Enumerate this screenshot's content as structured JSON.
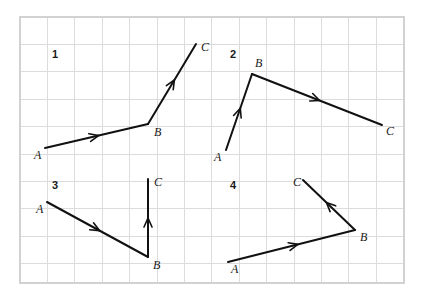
{
  "figure": {
    "background_color": "#ffffff",
    "ink_color": "#111111",
    "grid_color": "#dcdcdc",
    "grid": {
      "x0": 20,
      "y0": 17,
      "x1": 404,
      "y1": 283,
      "spacing": 27.4,
      "cols": 14,
      "rows": 10,
      "visible": true
    }
  },
  "panels": [
    {
      "number": "1",
      "number_pos": {
        "x": 52,
        "y": 58
      },
      "points": [
        {
          "label": "A",
          "x": 45,
          "y": 148,
          "label_x": 34,
          "label_y": 159
        },
        {
          "label": "B",
          "x": 148,
          "y": 124,
          "label_x": 154,
          "label_y": 136
        },
        {
          "label": "C",
          "x": 196,
          "y": 44,
          "label_x": 201,
          "label_y": 51
        }
      ],
      "segments": [
        {
          "from": "A",
          "to": "B",
          "arrow_at": 0.52
        },
        {
          "from": "B",
          "to": "C",
          "arrow_at": 0.55
        }
      ]
    },
    {
      "number": "2",
      "number_pos": {
        "x": 230,
        "y": 58
      },
      "points": [
        {
          "label": "A",
          "x": 226,
          "y": 150,
          "label_x": 214,
          "label_y": 161
        },
        {
          "label": "B",
          "x": 252,
          "y": 74,
          "label_x": 255,
          "label_y": 67
        },
        {
          "label": "C",
          "x": 382,
          "y": 125,
          "label_x": 386,
          "label_y": 135
        }
      ],
      "segments": [
        {
          "from": "A",
          "to": "B",
          "arrow_at": 0.55
        },
        {
          "from": "B",
          "to": "C",
          "arrow_at": 0.52
        }
      ]
    },
    {
      "number": "3",
      "number_pos": {
        "x": 52,
        "y": 189
      },
      "points": [
        {
          "label": "A",
          "x": 47,
          "y": 202,
          "label_x": 36,
          "label_y": 213
        },
        {
          "label": "B",
          "x": 148,
          "y": 257,
          "label_x": 153,
          "label_y": 269
        },
        {
          "label": "C",
          "x": 148,
          "y": 179,
          "label_x": 154,
          "label_y": 186
        }
      ],
      "segments": [
        {
          "from": "A",
          "to": "B",
          "arrow_at": 0.52
        },
        {
          "from": "B",
          "to": "C",
          "arrow_at": 0.5
        }
      ]
    },
    {
      "number": "4",
      "number_pos": {
        "x": 230,
        "y": 189
      },
      "points": [
        {
          "label": "A",
          "x": 228,
          "y": 262,
          "label_x": 231,
          "label_y": 273
        },
        {
          "label": "B",
          "x": 355,
          "y": 230,
          "label_x": 360,
          "label_y": 241
        },
        {
          "label": "C",
          "x": 303,
          "y": 180,
          "label_x": 293,
          "label_y": 186
        }
      ],
      "segments": [
        {
          "from": "A",
          "to": "B",
          "arrow_at": 0.55
        },
        {
          "from": "B",
          "to": "C",
          "arrow_at": 0.55
        }
      ]
    }
  ]
}
